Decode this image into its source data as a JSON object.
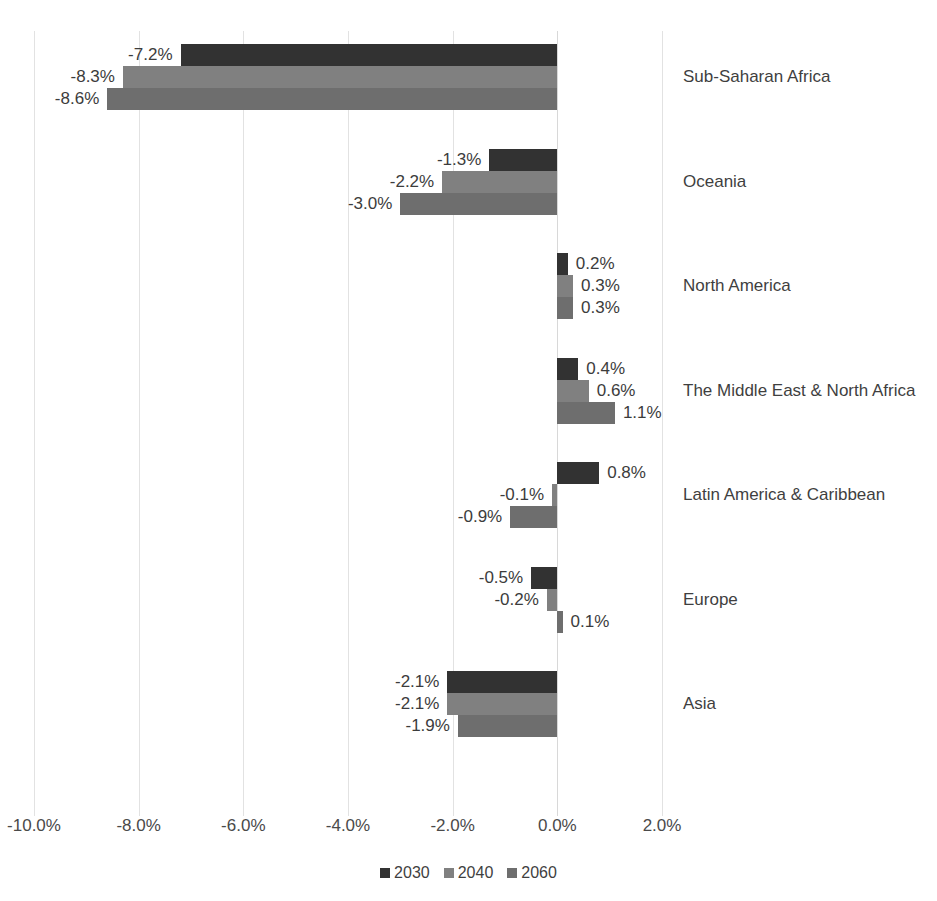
{
  "chart_data": {
    "type": "bar",
    "orientation": "horizontal",
    "title": "",
    "xlabel": "",
    "ylabel": "",
    "xlim": [
      -10.0,
      2.0
    ],
    "grid": true,
    "legend_position": "bottom",
    "categories": [
      "Sub-Saharan Africa",
      "Oceania",
      "North America",
      "The Middle East & North Africa",
      "Latin America & Caribbean",
      "Europe",
      "Asia"
    ],
    "xtick_labels": [
      "-10.0%",
      "-8.0%",
      "-6.0%",
      "-4.0%",
      "-2.0%",
      "0.0%",
      "2.0%"
    ],
    "xtick_values": [
      -10.0,
      -8.0,
      -6.0,
      -4.0,
      -2.0,
      0.0,
      2.0
    ],
    "series": [
      {
        "name": "2030",
        "color": "#323232",
        "values": [
          -7.2,
          -1.3,
          0.2,
          0.4,
          0.8,
          -0.5,
          -2.1
        ],
        "labels": [
          "-7.2%",
          "-1.3%",
          "0.2%",
          "0.4%",
          "0.8%",
          "-0.5%",
          "-2.1%"
        ]
      },
      {
        "name": "2040",
        "color": "#808080",
        "values": [
          -8.3,
          -2.2,
          0.3,
          0.6,
          -0.1,
          -0.2,
          -2.1
        ],
        "labels": [
          "-8.3%",
          "-2.2%",
          "0.3%",
          "0.6%",
          "-0.1%",
          "-0.2%",
          "-2.1%"
        ]
      },
      {
        "name": "2060",
        "color": "#6e6e6e",
        "values": [
          -8.6,
          -3.0,
          0.3,
          1.1,
          -0.9,
          0.1,
          -1.9
        ],
        "labels": [
          "-8.6%",
          "-3.0%",
          "0.3%",
          "1.1%",
          "-0.9%",
          "0.1%",
          "-1.9%"
        ]
      }
    ]
  },
  "legend": {
    "items": [
      {
        "label": "2030",
        "color": "#323232"
      },
      {
        "label": "2040",
        "color": "#808080"
      },
      {
        "label": "2060",
        "color": "#6e6e6e"
      }
    ]
  }
}
